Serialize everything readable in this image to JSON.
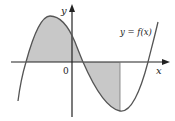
{
  "diagram": {
    "type": "function-graph",
    "function_label": "y = f(x)",
    "axes": {
      "x_label": "x",
      "y_label": "y",
      "origin_label": "0"
    },
    "shaded_regions": [
      {
        "name": "left-region",
        "description": "area between curve and x-axis, above the axis, from leftmost root to middle root"
      },
      {
        "name": "right-region",
        "description": "area between curve and x-axis, below the axis, from middle root to the vertical line at the local minimum"
      }
    ],
    "colors": {
      "curve": "#555555",
      "axes": "#222222",
      "shade": "#c8c8c8",
      "background": "#ffffff"
    }
  }
}
